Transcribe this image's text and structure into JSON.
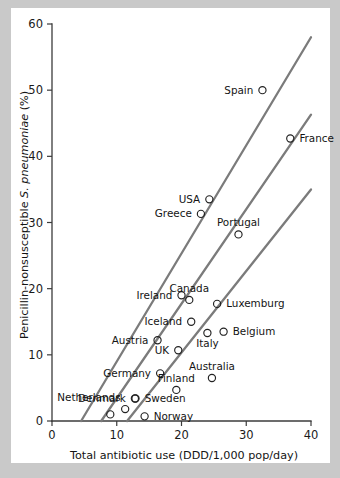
{
  "chart_data": {
    "type": "scatter",
    "title": "",
    "xlabel": "Total antibiotic use (DDD/1,000 pop/day)",
    "ylabel_parts": {
      "prefix": "Penicillin-nonsusceptible ",
      "species": "S. pneumoniae",
      "suffix": " (%)"
    },
    "ylabel": "Penicillin-nonsusceptible S. pneumoniae (%)",
    "xlim": [
      0,
      40
    ],
    "ylim": [
      0,
      60
    ],
    "xticks": [
      0,
      10,
      20,
      30,
      40
    ],
    "yticks": [
      0,
      10,
      20,
      30,
      40,
      50,
      60
    ],
    "grid": false,
    "legend": "none",
    "marker_style": "open-circle",
    "points": [
      {
        "label": "Spain",
        "x": 32.5,
        "y": 50.0,
        "label_pos": "left"
      },
      {
        "label": "France",
        "x": 36.8,
        "y": 42.7,
        "label_pos": "right"
      },
      {
        "label": "USA",
        "x": 24.3,
        "y": 33.5,
        "label_pos": "left"
      },
      {
        "label": "Greece",
        "x": 23.0,
        "y": 31.3,
        "label_pos": "left"
      },
      {
        "label": "Portugal",
        "x": 28.8,
        "y": 28.2,
        "label_pos": "above"
      },
      {
        "label": "Ireland",
        "x": 20.0,
        "y": 19.0,
        "label_pos": "left"
      },
      {
        "label": "Canada",
        "x": 21.2,
        "y": 18.3,
        "label_pos": "above"
      },
      {
        "label": "Luxemburg",
        "x": 25.5,
        "y": 17.7,
        "label_pos": "right"
      },
      {
        "label": "Iceland",
        "x": 21.5,
        "y": 15.0,
        "label_pos": "left"
      },
      {
        "label": "Belgium",
        "x": 26.5,
        "y": 13.5,
        "label_pos": "right"
      },
      {
        "label": "Italy",
        "x": 24.0,
        "y": 13.3,
        "label_pos": "below"
      },
      {
        "label": "Austria",
        "x": 16.3,
        "y": 12.2,
        "label_pos": "left"
      },
      {
        "label": "UK",
        "x": 19.5,
        "y": 10.7,
        "label_pos": "left"
      },
      {
        "label": "Germany",
        "x": 16.7,
        "y": 7.2,
        "label_pos": "left"
      },
      {
        "label": "Australia",
        "x": 24.7,
        "y": 6.5,
        "label_pos": "above"
      },
      {
        "label": "Finland",
        "x": 19.2,
        "y": 4.7,
        "label_pos": "above"
      },
      {
        "label": "Denmark",
        "x": 12.8,
        "y": 3.4,
        "label_pos": "left"
      },
      {
        "label": "Sweden",
        "x": 12.9,
        "y": 3.4,
        "label_pos": "right"
      },
      {
        "label": "Netherlands",
        "x": 11.3,
        "y": 1.8,
        "label_pos": "above-left"
      },
      {
        "label": "Norway",
        "x": 14.3,
        "y": 0.7,
        "label_pos": "right"
      },
      {
        "label": "Luxembourg2",
        "x": 9.0,
        "y": 1.0,
        "label_pos": "none"
      }
    ],
    "trend_lines": [
      {
        "name": "upper-trend-line",
        "x1": 4.5,
        "y1": 0,
        "x2": 40.0,
        "y2": 58.0
      },
      {
        "name": "middle-trend-line",
        "x1": 7.6,
        "y1": 0,
        "x2": 40.0,
        "y2": 46.3
      },
      {
        "name": "lower-trend-line",
        "x1": 11.6,
        "y1": 0,
        "x2": 40.0,
        "y2": 35.0
      }
    ],
    "colors": {
      "background": "#c9c9c9",
      "panel": "#ffffff",
      "axis": "#3b3b3b",
      "trend": "#7b7b7b",
      "marker": "#222222",
      "text": "#141414"
    }
  }
}
